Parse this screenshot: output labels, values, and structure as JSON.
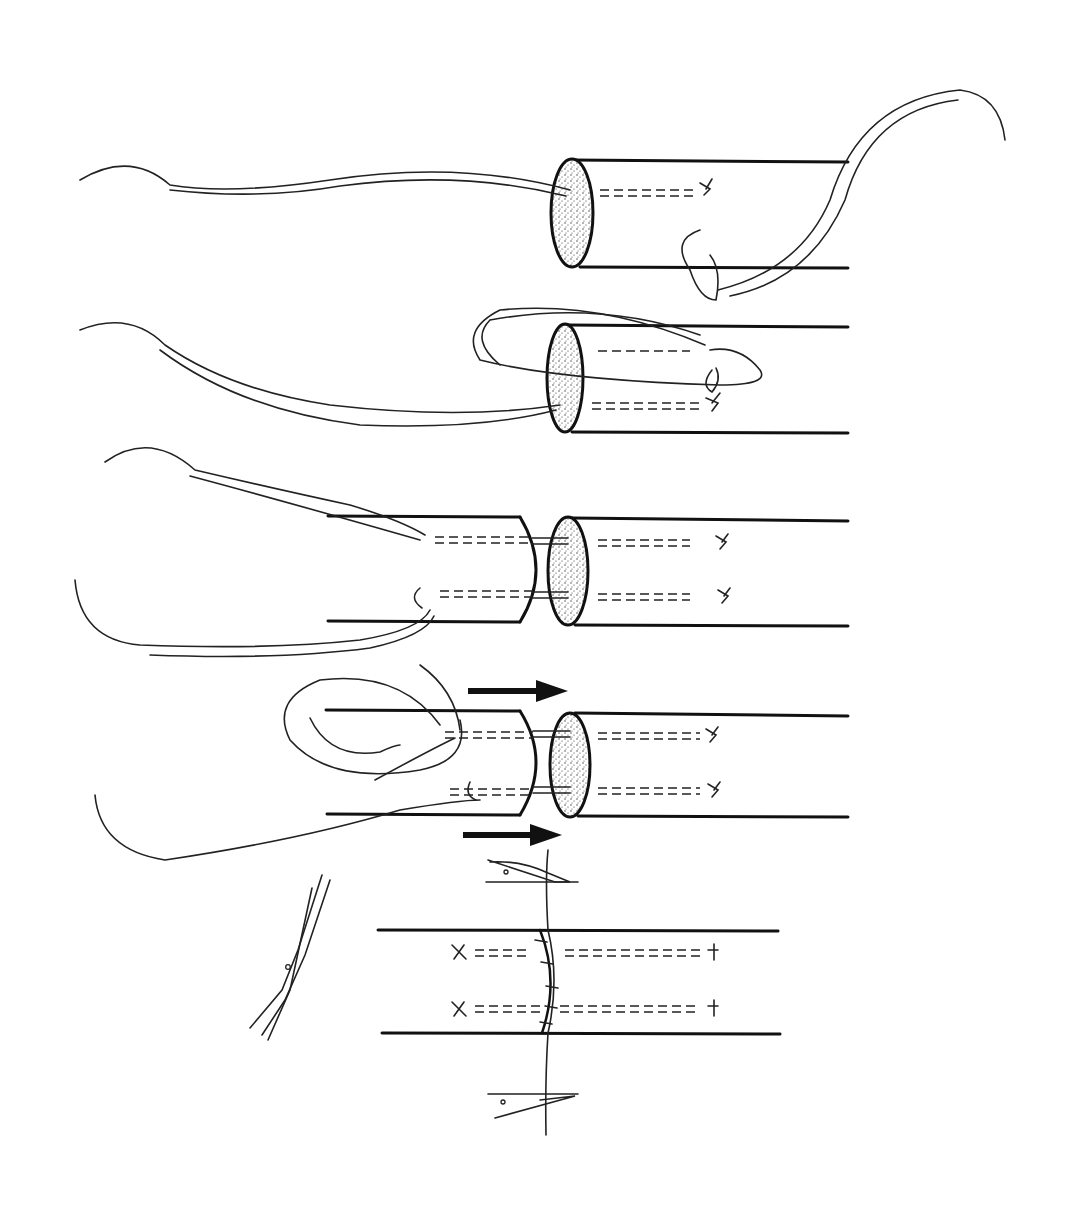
{
  "figure": {
    "background": "#ffffff",
    "ink_color": "#111111",
    "panels": [
      {
        "id": 1,
        "label": "Suture passed through stump; locking loop and knot placed",
        "y": 160
      },
      {
        "id": 2,
        "label": "Suture looped back through stump",
        "y": 325
      },
      {
        "id": 3,
        "label": "Both ends with core sutures approximated",
        "y": 520
      },
      {
        "id": 4,
        "label": "Ends drawn together (arrows)",
        "y": 715
      },
      {
        "id": 5,
        "label": "Completed repair with peripheral running suture; scissors trimming",
        "y": 930
      }
    ],
    "icons": [
      "arrow-right-icon",
      "arrow-right-icon",
      "scissors-icon",
      "forceps-icon",
      "forceps-icon"
    ]
  }
}
